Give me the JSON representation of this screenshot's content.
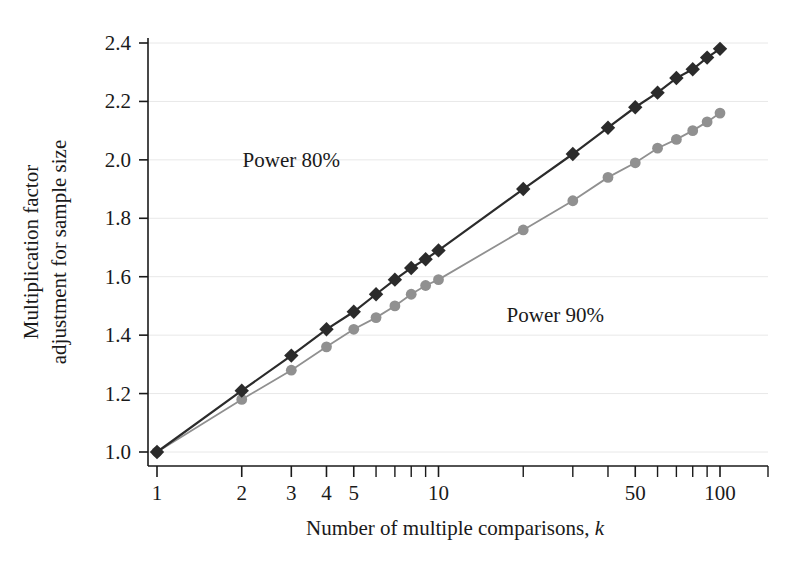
{
  "chart_data": {
    "type": "line",
    "title": "",
    "xlabel": "Number of multiple comparisons, k",
    "ylabel": "Multiplication factor\nadjustment for sample size",
    "ylabel_line1": "Multiplication factor",
    "ylabel_line2": "adjustment for sample size",
    "xscale": "log",
    "yscale": "linear",
    "xlim": [
      1,
      130
    ],
    "ylim": [
      0.95,
      2.45
    ],
    "grid": true,
    "grid_axis": "y",
    "legend_position": "inline-annotations",
    "x_tick_labels": [
      "1",
      "2",
      "3",
      "4",
      "5",
      "10",
      "50",
      "100"
    ],
    "x_tick_values": [
      1,
      2,
      3,
      4,
      5,
      10,
      50,
      100
    ],
    "x_minor_ticks": [
      6,
      7,
      8,
      9,
      20,
      30,
      40,
      60,
      70,
      80,
      90
    ],
    "y_tick_labels": [
      "1.0",
      "1.2",
      "1.4",
      "1.6",
      "1.8",
      "2.0",
      "2.2",
      "2.4"
    ],
    "y_tick_values": [
      1.0,
      1.2,
      1.4,
      1.6,
      1.8,
      2.0,
      2.2,
      2.4
    ],
    "annotations": [
      {
        "text": "Power 80%",
        "x": 3.0,
        "y": 2.0,
        "series": "Power 80%"
      },
      {
        "text": "Power 90%",
        "x": 26.0,
        "y": 1.47,
        "series": "Power 90%"
      }
    ],
    "series": [
      {
        "name": "Power 80%",
        "color": "#2b2b2b",
        "marker": "diamond",
        "x": [
          1,
          2,
          3,
          4,
          5,
          6,
          7,
          8,
          9,
          10,
          20,
          30,
          40,
          50,
          60,
          70,
          80,
          90,
          100
        ],
        "values": [
          1.0,
          1.21,
          1.33,
          1.42,
          1.48,
          1.54,
          1.59,
          1.63,
          1.66,
          1.69,
          1.9,
          2.02,
          2.11,
          2.18,
          2.23,
          2.28,
          2.31,
          2.35,
          2.38
        ]
      },
      {
        "name": "Power 90%",
        "color": "#909090",
        "marker": "circle",
        "x": [
          1,
          2,
          3,
          4,
          5,
          6,
          7,
          8,
          9,
          10,
          20,
          30,
          40,
          50,
          60,
          70,
          80,
          90,
          100
        ],
        "values": [
          1.0,
          1.18,
          1.28,
          1.36,
          1.42,
          1.46,
          1.5,
          1.54,
          1.57,
          1.59,
          1.76,
          1.86,
          1.94,
          1.99,
          2.04,
          2.07,
          2.1,
          2.13,
          2.16
        ]
      }
    ]
  },
  "axes": {
    "spine_color": "#1a1a1a",
    "grid_color": "#e8e8e8"
  }
}
